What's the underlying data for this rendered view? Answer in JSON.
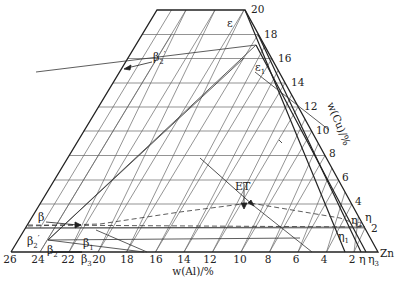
{
  "diagram": {
    "type": "ternary-phase-diagram-corner",
    "corner_label": "Zn",
    "bottom_axis": {
      "label": "w(Al)/%",
      "ticks": [
        "26",
        "24",
        "22",
        "20",
        "18",
        "16",
        "14",
        "12",
        "10",
        "8",
        "6",
        "4",
        "2"
      ]
    },
    "right_axis": {
      "label": "w(Cu)/%",
      "ticks": [
        "20",
        "18",
        "16",
        "14",
        "12",
        "10",
        "8",
        "6",
        "4",
        "2"
      ]
    },
    "phase_labels": {
      "epsilon": "ε",
      "epsilon1": "ε",
      "epsilon1_sub": "1",
      "beta2p_top": "β",
      "beta2p_top_sub": "2",
      "beta2p_top_prime": "′",
      "beta": "β",
      "beta2p_left": "β",
      "beta2p_left_sub": "2",
      "beta2p_left_prime": "′",
      "beta2": "β",
      "beta2_sub": "2",
      "beta1": "β",
      "beta1_sub": "1",
      "beta3": "β",
      "beta3_sub": "3",
      "ET": "ET",
      "eta": "η",
      "eta2": "η",
      "eta2_sub": "2",
      "eta1": "η",
      "eta1_sub": "1",
      "eta_bottom": "η",
      "eta3": "η",
      "eta3_sub": "3"
    },
    "colors": {
      "line": "#333333",
      "grid": "#555555",
      "background": "#ffffff"
    }
  }
}
